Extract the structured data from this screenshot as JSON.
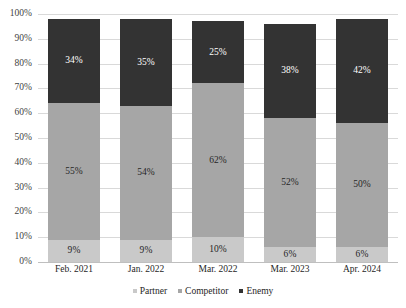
{
  "chart_data": {
    "type": "bar",
    "subtype": "stacked-bar-100-percent",
    "title": "",
    "subtitle": "",
    "xlabel": "",
    "ylabel": "",
    "categories": [
      "Feb. 2021",
      "Jan. 2022",
      "Mar. 2022",
      "Mar. 2023",
      "Apr. 2024"
    ],
    "series": [
      {
        "name": "Partner",
        "color": "#c9c9c9",
        "values": [
          9,
          9,
          10,
          6,
          6
        ],
        "labels": [
          "9%",
          "9%",
          "10%",
          "6%",
          "6%"
        ]
      },
      {
        "name": "Competitor",
        "color": "#a6a6a6",
        "values": [
          55,
          54,
          62,
          52,
          50
        ],
        "labels": [
          "55%",
          "54%",
          "62%",
          "52%",
          "50%"
        ]
      },
      {
        "name": "Enemy",
        "color": "#333333",
        "values": [
          34,
          35,
          25,
          38,
          42
        ],
        "labels": [
          "34%",
          "35%",
          "25%",
          "38%",
          "42%"
        ]
      }
    ],
    "ylim": [
      0,
      100
    ],
    "y_ticks": [
      "0%",
      "10%",
      "20%",
      "30%",
      "40%",
      "50%",
      "60%",
      "70%",
      "80%",
      "90%",
      "100%"
    ],
    "y_tick_values": [
      0,
      10,
      20,
      30,
      40,
      50,
      60,
      70,
      80,
      90,
      100
    ],
    "grid": true,
    "grid_orientation": "horizontal",
    "grid_color": "#d9d9d9",
    "legend": [
      "Partner",
      "Competitor",
      "Enemy"
    ],
    "legend_position": "bottom",
    "stack_order_bottom_to_top": [
      "Partner",
      "Competitor",
      "Enemy"
    ]
  }
}
